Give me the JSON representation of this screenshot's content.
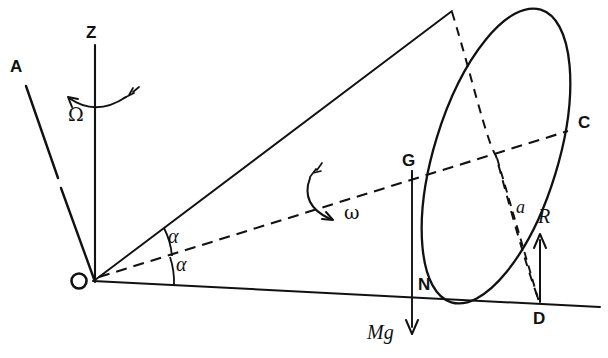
{
  "figure": {
    "type": "physics-diagram",
    "background_color": "#ffffff",
    "ink_color": "#111111",
    "width": 608,
    "height": 358
  },
  "labels": {
    "axis_A": "A",
    "axis_Z": "Z",
    "axis_C": "C",
    "origin_O": "O",
    "center_G": "G",
    "normal_N": "N",
    "contact_D": "D",
    "precession_rate": "Ω",
    "spin_rate": "ω",
    "half_angle_upper": "α",
    "half_angle_lower": "α",
    "disk_radius": "a",
    "reaction_force": "R",
    "weight_force": "Mg"
  },
  "geometry": {
    "origin": [
      95,
      280
    ],
    "cone_apex": [
      452,
      10
    ],
    "symmetry_axis_end": [
      570,
      130
    ],
    "ground_line_end": [
      600,
      306
    ],
    "z_axis_top": [
      95,
      45
    ],
    "a_line_top": [
      26,
      86
    ],
    "disk_center": [
      495,
      155
    ],
    "contact_point": [
      540,
      303
    ],
    "center_of_mass": [
      408,
      172
    ]
  }
}
